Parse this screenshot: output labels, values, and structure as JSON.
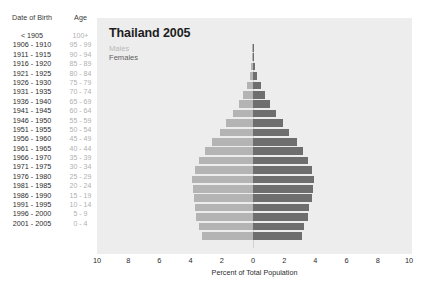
{
  "table": {
    "header_date_of_birth": "Date of Birth",
    "header_age": "Age",
    "rows": [
      {
        "dob": "< 1905",
        "age": "100+"
      },
      {
        "dob": "1906 - 1910",
        "age": "95 - 99"
      },
      {
        "dob": "1911 - 1915",
        "age": "90 - 94"
      },
      {
        "dob": "1916 - 1920",
        "age": "85 - 89"
      },
      {
        "dob": "1921 - 1925",
        "age": "80 - 84"
      },
      {
        "dob": "1926 - 1930",
        "age": "75 - 79"
      },
      {
        "dob": "1931 - 1935",
        "age": "70 - 74"
      },
      {
        "dob": "1936 - 1940",
        "age": "65 - 69"
      },
      {
        "dob": "1941 - 1945",
        "age": "60 - 64"
      },
      {
        "dob": "1946 - 1950",
        "age": "55 - 59"
      },
      {
        "dob": "1951 - 1955",
        "age": "50 - 54"
      },
      {
        "dob": "1956 - 1960",
        "age": "45 - 49"
      },
      {
        "dob": "1961 - 1965",
        "age": "40 - 44"
      },
      {
        "dob": "1966 - 1970",
        "age": "35 - 39"
      },
      {
        "dob": "1971 - 1975",
        "age": "30 - 34"
      },
      {
        "dob": "1976 - 1980",
        "age": "25 - 29"
      },
      {
        "dob": "1981 - 1985",
        "age": "20 - 24"
      },
      {
        "dob": "1986 - 1990",
        "age": "15 - 19"
      },
      {
        "dob": "1991 - 1995",
        "age": "10 - 14"
      },
      {
        "dob": "1996 - 2000",
        "age": "5 - 9"
      },
      {
        "dob": "2001 - 2005",
        "age": "0 - 4"
      }
    ]
  },
  "legend": {
    "males": "Males",
    "females": "Females",
    "males_color": "#b4b4b4",
    "females_color": "#6e6e6e"
  },
  "chart_data": {
    "type": "bar",
    "subtype": "population-pyramid",
    "title": "Thailand 2005",
    "xlabel": "Percent of Total Population",
    "ylabel": "",
    "xlim": [
      -10,
      10
    ],
    "xticks": [
      10,
      8,
      6,
      4,
      2,
      0,
      2,
      4,
      6,
      8,
      10
    ],
    "grid": false,
    "legend_position": "top-left",
    "categories": [
      "100+",
      "95 - 99",
      "90 - 94",
      "85 - 89",
      "80 - 84",
      "75 - 79",
      "70 - 74",
      "65 - 69",
      "60 - 64",
      "55 - 59",
      "50 - 54",
      "45 - 49",
      "40 - 44",
      "35 - 39",
      "30 - 34",
      "25 - 29",
      "20 - 24",
      "15 - 19",
      "10 - 14",
      "5 - 9",
      "0 - 4"
    ],
    "series": [
      {
        "name": "Males",
        "color": "#b4b4b4",
        "values": [
          0.02,
          0.05,
          0.1,
          0.2,
          0.38,
          0.62,
          0.92,
          1.28,
          1.7,
          2.1,
          2.65,
          3.1,
          3.45,
          3.75,
          3.9,
          3.85,
          3.8,
          3.7,
          3.65,
          3.45,
          3.3
        ]
      },
      {
        "name": "Females",
        "color": "#6e6e6e",
        "values": [
          0.03,
          0.07,
          0.14,
          0.28,
          0.5,
          0.8,
          1.1,
          1.5,
          1.9,
          2.3,
          2.8,
          3.2,
          3.55,
          3.8,
          3.9,
          3.85,
          3.8,
          3.6,
          3.5,
          3.3,
          3.15
        ]
      }
    ]
  }
}
